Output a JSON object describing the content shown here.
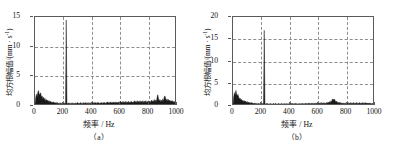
{
  "figure": {
    "panels": [
      {
        "id": "panel-a",
        "caption": "（a）",
        "ylabel_text": "均方根幅值/(mm · s",
        "ylabel_sup": "-1",
        "ylabel_tail": ")",
        "xlabel": "频率 / Hz",
        "yticks": [
          "0",
          "5",
          "10",
          "15"
        ],
        "xticks": [
          "0",
          "200",
          "400",
          "600",
          "800",
          "1000"
        ]
      },
      {
        "id": "panel-b",
        "caption": "（b）",
        "ylabel_text": "均方根幅值/(mm · s",
        "ylabel_sup": "-1",
        "ylabel_tail": ")",
        "xlabel": "频率 / Hz",
        "yticks": [
          "0",
          "5",
          "10",
          "15",
          "20"
        ],
        "xticks": [
          "0",
          "200",
          "400",
          "600",
          "800",
          "1000"
        ]
      }
    ],
    "colors": {
      "trace": "#1a1a1a",
      "grid": "#8e8e8e",
      "frame": "#5a5a5a",
      "text": "#111111",
      "background": "#ffffff"
    }
  },
  "chart_data": [
    {
      "type": "line",
      "id": "panel-a",
      "title": "（a）",
      "xlabel": "频率 / Hz",
      "ylabel": "均方根幅值/(mm · s-1)",
      "xlim": [
        0,
        1000
      ],
      "ylim": [
        0,
        15
      ],
      "xticks": [
        0,
        200,
        400,
        600,
        800,
        1000
      ],
      "yticks": [
        0,
        5,
        10,
        15
      ],
      "grid": true,
      "legend": null,
      "peaks": [
        {
          "x": 220,
          "y": 14.5,
          "note": "dominant spectral line"
        },
        {
          "x": 25,
          "y": 2.6
        },
        {
          "x": 38,
          "y": 2.2
        },
        {
          "x": 855,
          "y": 1.9
        },
        {
          "x": 900,
          "y": 1.7
        }
      ],
      "x": [
        0,
        5,
        10,
        15,
        20,
        25,
        30,
        35,
        40,
        45,
        50,
        55,
        60,
        65,
        70,
        75,
        80,
        85,
        90,
        95,
        100,
        105,
        110,
        115,
        120,
        125,
        130,
        135,
        140,
        145,
        150,
        155,
        160,
        165,
        170,
        175,
        180,
        185,
        190,
        195,
        200,
        205,
        210,
        215,
        220,
        225,
        230,
        235,
        240,
        245,
        250,
        255,
        260,
        265,
        270,
        275,
        280,
        285,
        290,
        295,
        300,
        305,
        310,
        315,
        320,
        325,
        330,
        335,
        340,
        345,
        350,
        355,
        360,
        365,
        370,
        375,
        380,
        385,
        390,
        395,
        400,
        405,
        410,
        415,
        420,
        425,
        430,
        435,
        440,
        445,
        450,
        455,
        460,
        465,
        470,
        475,
        480,
        485,
        490,
        495,
        500,
        505,
        510,
        515,
        520,
        525,
        530,
        535,
        540,
        545,
        550,
        555,
        560,
        565,
        570,
        575,
        580,
        585,
        590,
        595,
        600,
        605,
        610,
        615,
        620,
        625,
        630,
        635,
        640,
        645,
        650,
        655,
        660,
        665,
        670,
        675,
        680,
        685,
        690,
        695,
        700,
        705,
        710,
        715,
        720,
        725,
        730,
        735,
        740,
        745,
        750,
        755,
        760,
        765,
        770,
        775,
        780,
        785,
        790,
        795,
        800,
        805,
        810,
        815,
        820,
        825,
        830,
        835,
        840,
        845,
        850,
        855,
        860,
        865,
        870,
        875,
        880,
        885,
        890,
        895,
        900,
        905,
        910,
        915,
        920,
        925,
        930,
        935,
        940,
        945,
        950,
        955,
        960,
        965,
        970,
        975,
        980,
        985,
        990,
        995,
        1000
      ],
      "values": [
        0.2,
        1.4,
        2.0,
        1.5,
        2.3,
        2.6,
        1.8,
        2.1,
        2.2,
        1.5,
        1.7,
        1.2,
        1.5,
        1.0,
        1.3,
        0.9,
        1.1,
        0.8,
        1.0,
        0.7,
        0.9,
        0.6,
        0.8,
        0.6,
        0.7,
        0.5,
        0.7,
        0.5,
        0.6,
        0.5,
        0.6,
        0.4,
        0.6,
        0.4,
        0.5,
        0.4,
        0.5,
        0.4,
        0.5,
        0.4,
        0.5,
        0.4,
        0.5,
        0.4,
        14.5,
        0.5,
        0.4,
        0.5,
        0.4,
        0.5,
        0.4,
        0.5,
        0.4,
        0.5,
        0.4,
        0.5,
        0.4,
        0.5,
        0.4,
        0.5,
        0.6,
        0.4,
        0.5,
        0.4,
        0.6,
        0.4,
        0.5,
        0.4,
        0.6,
        0.4,
        0.5,
        0.5,
        0.6,
        0.4,
        0.5,
        0.4,
        0.6,
        0.4,
        0.5,
        0.4,
        0.7,
        0.5,
        0.6,
        0.4,
        0.6,
        0.5,
        0.6,
        0.4,
        0.6,
        0.5,
        0.6,
        0.4,
        0.5,
        0.5,
        0.6,
        0.4,
        0.6,
        0.5,
        0.6,
        0.4,
        0.6,
        0.5,
        0.7,
        0.5,
        0.6,
        0.5,
        0.7,
        0.5,
        0.6,
        0.5,
        0.7,
        0.5,
        0.6,
        0.5,
        0.7,
        0.5,
        0.6,
        0.5,
        0.7,
        0.5,
        0.8,
        0.5,
        0.7,
        0.5,
        0.8,
        0.5,
        0.7,
        0.5,
        0.8,
        0.5,
        0.7,
        0.5,
        0.8,
        0.5,
        0.7,
        0.6,
        0.8,
        0.5,
        0.7,
        0.6,
        0.9,
        0.6,
        0.8,
        0.6,
        0.9,
        0.6,
        0.8,
        0.6,
        0.9,
        0.6,
        0.8,
        0.6,
        0.9,
        0.6,
        0.8,
        0.6,
        0.9,
        0.6,
        0.8,
        0.6,
        0.9,
        0.6,
        0.8,
        0.6,
        1.0,
        0.7,
        0.9,
        0.7,
        1.1,
        0.7,
        1.0,
        0.7,
        1.5,
        1.9,
        1.2,
        0.8,
        1.1,
        0.7,
        1.0,
        0.7,
        1.2,
        0.8,
        1.5,
        1.7,
        1.3,
        0.9,
        1.2,
        0.8,
        1.1,
        0.8,
        1.0,
        0.7,
        0.9,
        0.7,
        0.9,
        0.6,
        0.8,
        0.6,
        0.8,
        0.6,
        0.7,
        0.5,
        0.6
      ]
    },
    {
      "type": "line",
      "id": "panel-b",
      "title": "（b）",
      "xlabel": "频率 / Hz",
      "ylabel": "均方根幅值/(mm · s-1)",
      "xlim": [
        0,
        1000
      ],
      "ylim": [
        0,
        20
      ],
      "xticks": [
        0,
        200,
        400,
        600,
        800,
        1000
      ],
      "yticks": [
        0,
        5,
        10,
        15,
        20
      ],
      "grid": true,
      "legend": null,
      "peaks": [
        {
          "x": 220,
          "y": 17.0,
          "note": "dominant spectral line"
        },
        {
          "x": 20,
          "y": 3.5
        },
        {
          "x": 35,
          "y": 2.6
        },
        {
          "x": 700,
          "y": 1.6
        },
        {
          "x": 715,
          "y": 1.5
        }
      ],
      "x": [
        0,
        5,
        10,
        15,
        20,
        25,
        30,
        35,
        40,
        45,
        50,
        55,
        60,
        65,
        70,
        75,
        80,
        85,
        90,
        95,
        100,
        105,
        110,
        115,
        120,
        125,
        130,
        135,
        140,
        145,
        150,
        155,
        160,
        165,
        170,
        175,
        180,
        185,
        190,
        195,
        200,
        205,
        210,
        215,
        220,
        225,
        230,
        235,
        240,
        245,
        250,
        255,
        260,
        265,
        270,
        275,
        280,
        285,
        290,
        295,
        300,
        305,
        310,
        315,
        320,
        325,
        330,
        335,
        340,
        345,
        350,
        355,
        360,
        365,
        370,
        375,
        380,
        385,
        390,
        395,
        400,
        405,
        410,
        415,
        420,
        425,
        430,
        435,
        440,
        445,
        450,
        455,
        460,
        465,
        470,
        475,
        480,
        485,
        490,
        495,
        500,
        505,
        510,
        515,
        520,
        525,
        530,
        535,
        540,
        545,
        550,
        555,
        560,
        565,
        570,
        575,
        580,
        585,
        590,
        595,
        600,
        605,
        610,
        615,
        620,
        625,
        630,
        635,
        640,
        645,
        650,
        655,
        660,
        665,
        670,
        675,
        680,
        685,
        690,
        695,
        700,
        705,
        710,
        715,
        720,
        725,
        730,
        735,
        740,
        745,
        750,
        755,
        760,
        765,
        770,
        775,
        780,
        785,
        790,
        795,
        800,
        805,
        810,
        815,
        820,
        825,
        830,
        835,
        840,
        845,
        850,
        855,
        860,
        865,
        870,
        875,
        880,
        885,
        890,
        895,
        900,
        905,
        910,
        915,
        920,
        925,
        930,
        935,
        940,
        945,
        950,
        955,
        960,
        965,
        970,
        975,
        980,
        985,
        990,
        995,
        1000
      ],
      "values": [
        0.3,
        2.1,
        3.0,
        2.4,
        3.5,
        2.8,
        2.2,
        2.6,
        2.0,
        1.6,
        1.8,
        1.3,
        1.5,
        1.1,
        1.3,
        1.0,
        1.2,
        0.9,
        1.1,
        0.8,
        1.0,
        0.7,
        0.9,
        0.7,
        0.8,
        0.6,
        0.8,
        0.6,
        0.7,
        0.5,
        0.7,
        0.5,
        0.6,
        0.5,
        0.6,
        0.4,
        0.6,
        0.4,
        0.6,
        0.4,
        0.6,
        0.4,
        0.6,
        0.5,
        17.0,
        0.6,
        0.4,
        0.6,
        0.4,
        0.6,
        0.4,
        0.5,
        0.4,
        0.6,
        0.4,
        0.5,
        0.4,
        0.6,
        0.4,
        0.5,
        0.6,
        0.4,
        0.5,
        0.4,
        0.6,
        0.4,
        0.5,
        0.4,
        0.6,
        0.4,
        0.5,
        0.4,
        0.6,
        0.4,
        0.5,
        0.4,
        0.6,
        0.4,
        0.5,
        0.4,
        0.7,
        0.5,
        0.6,
        0.4,
        0.6,
        0.4,
        0.6,
        0.4,
        0.6,
        0.4,
        0.6,
        0.4,
        0.5,
        0.4,
        0.6,
        0.4,
        0.6,
        0.4,
        0.6,
        0.4,
        0.6,
        0.4,
        0.6,
        0.5,
        0.6,
        0.4,
        0.7,
        0.5,
        0.6,
        0.4,
        0.7,
        0.5,
        0.6,
        0.4,
        0.7,
        0.5,
        0.6,
        0.5,
        0.7,
        0.5,
        0.7,
        0.5,
        0.7,
        0.5,
        0.8,
        0.5,
        0.7,
        0.5,
        0.8,
        0.5,
        0.7,
        0.5,
        0.8,
        0.6,
        0.9,
        0.6,
        1.0,
        0.7,
        1.2,
        0.9,
        1.6,
        1.4,
        1.5,
        1.5,
        1.2,
        0.9,
        1.1,
        0.7,
        0.9,
        0.6,
        0.8,
        0.6,
        0.8,
        0.5,
        0.7,
        0.5,
        0.7,
        0.5,
        0.7,
        0.5,
        0.7,
        0.5,
        0.8,
        0.5,
        0.7,
        0.5,
        0.8,
        0.5,
        0.7,
        0.5,
        0.8,
        0.5,
        0.7,
        0.5,
        0.8,
        0.5,
        0.7,
        0.5,
        0.8,
        0.5,
        0.7,
        0.5,
        0.8,
        0.5,
        0.7,
        0.5,
        0.8,
        0.5,
        0.7,
        0.5,
        0.7,
        0.5,
        0.7,
        0.4,
        0.6,
        0.4,
        0.6,
        0.4,
        0.5
      ]
    }
  ]
}
